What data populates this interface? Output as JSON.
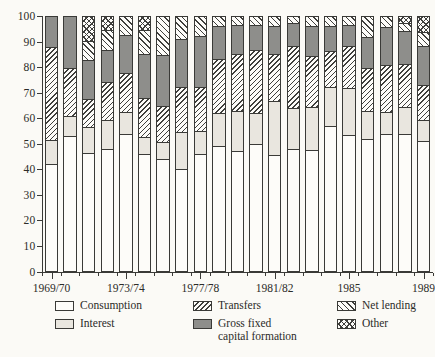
{
  "figure": {
    "background_color": "#fbfaf6",
    "axis_color": "#3a3a37",
    "colors": {
      "consumption": "#fdfcf9",
      "interest": "#e9e6df",
      "transfers_hatch": "#3f3f3c",
      "gross_fixed": "#8e8e8b",
      "net_lending_hatch": "#3f3f3c",
      "other_hatch": "#3f3f3c"
    }
  },
  "y_axis": {
    "tick_labels": [
      "100",
      "90",
      "80",
      "70",
      "60",
      "50",
      "40",
      "30",
      "20",
      "10",
      "0"
    ],
    "tick_values": [
      100,
      90,
      80,
      70,
      60,
      50,
      40,
      30,
      20,
      10,
      0
    ]
  },
  "x_axis": {
    "tick_labels": [
      "1969/70",
      "1973/74",
      "1977/78",
      "1981/82",
      "1985",
      "1989"
    ],
    "labeled_bar_indices": [
      0,
      4,
      8,
      12,
      16,
      20
    ]
  },
  "legend": {
    "consumption": "Consumption",
    "interest": "Interest",
    "transfers": "Transfers",
    "gross_fixed_line1": "Gross fixed",
    "gross_fixed_line2": "capital formation",
    "net_lending": "Net lending",
    "other": "Other"
  },
  "chart_data": {
    "type": "bar",
    "stacked": true,
    "units": "percent of total",
    "ylim": [
      0,
      100
    ],
    "grid": false,
    "legend_position": "bottom",
    "categories": [
      "1969/70",
      "1970/71",
      "1971/72",
      "1972/73",
      "1973/74",
      "1974/75",
      "1975/76",
      "1976/77",
      "1977/78",
      "1978/79",
      "1979/80",
      "1980/81",
      "1981/82",
      "1982/83",
      "1983/84",
      "1984/85",
      "1985/86",
      "1986/87",
      "1987/88",
      "1988/89",
      "1989/90"
    ],
    "series": [
      {
        "name": "Consumption",
        "pattern": "plain",
        "values": [
          42,
          53,
          46.5,
          48,
          54,
          46,
          44,
          40,
          46,
          49,
          47,
          50,
          45.5,
          48,
          47.5,
          57,
          53.5,
          52,
          54,
          54,
          51
        ]
      },
      {
        "name": "Interest",
        "pattern": "lightgray",
        "values": [
          9.5,
          8,
          10,
          11.5,
          8.5,
          6.5,
          6.5,
          14.5,
          9,
          13,
          16,
          12,
          21.5,
          16,
          17,
          15.5,
          18.5,
          11,
          8.5,
          10.5,
          8.5
        ]
      },
      {
        "name": "Transfers",
        "pattern": "diagup",
        "values": [
          36.5,
          19,
          11,
          15,
          15.5,
          15.5,
          14.5,
          18,
          17.5,
          21.5,
          22.5,
          25,
          18.5,
          24.5,
          20,
          14,
          16.5,
          17,
          18.5,
          17,
          13.5
        ]
      },
      {
        "name": "Gross fixed capital formation",
        "pattern": "darkgray",
        "values": [
          12,
          20,
          15.5,
          12.5,
          15,
          17.5,
          20,
          19,
          20,
          13,
          11.5,
          10,
          11,
          9,
          12,
          10,
          8.5,
          12,
          15,
          13,
          15.5
        ]
      },
      {
        "name": "Net lending",
        "pattern": "diagdown",
        "values": [
          0,
          0,
          7.5,
          8,
          7,
          9.5,
          15,
          8.5,
          7.5,
          3.5,
          3,
          3,
          3.5,
          2.5,
          3.5,
          3.5,
          3,
          8,
          4,
          3,
          5.5
        ]
      },
      {
        "name": "Other",
        "pattern": "cross",
        "values": [
          0,
          0,
          9.5,
          5,
          0,
          5,
          0,
          0,
          0,
          0,
          0,
          0,
          0,
          0,
          0,
          0,
          0,
          0,
          0,
          2.5,
          6
        ]
      }
    ]
  }
}
